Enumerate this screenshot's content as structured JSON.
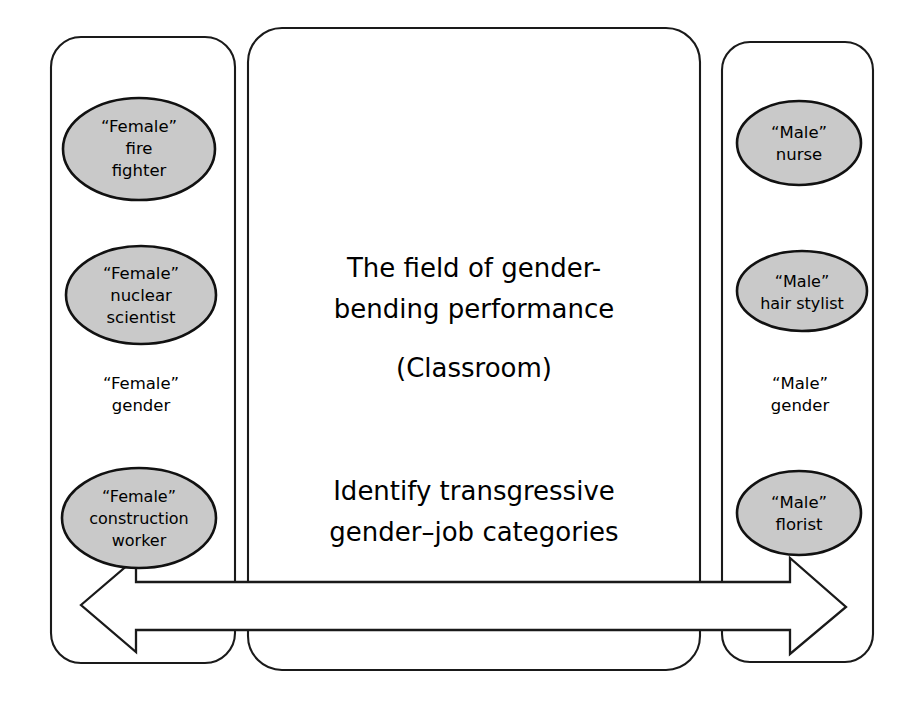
{
  "diagram": {
    "background_color": "#ffffff",
    "line_color": "#1a1a1a",
    "node_fill_color": "#c9c9c9",
    "text_color": "#000000"
  },
  "left_panel": {
    "name": "Female gender panel",
    "axis_label": {
      "line1": "“Female”",
      "line2": "gender"
    },
    "nodes": [
      {
        "id": "female-fire-fighter",
        "lines": [
          "“Female”",
          "fire",
          "fighter"
        ]
      },
      {
        "id": "female-nuclear-scientist",
        "lines": [
          "“Female”",
          "nuclear",
          "scientist"
        ]
      },
      {
        "id": "female-construction-worker",
        "lines": [
          "“Female”",
          "construction",
          "worker"
        ]
      }
    ]
  },
  "center_panel": {
    "name": "Classroom panel",
    "heading_lines": [
      "The field of gender-",
      "bending performance"
    ],
    "subtitle": "(Classroom)",
    "task_lines": [
      "Identify transgressive",
      "gender–job categories"
    ]
  },
  "right_panel": {
    "name": "Male gender panel",
    "axis_label": {
      "line1": "“Male”",
      "line2": "gender"
    },
    "nodes": [
      {
        "id": "male-nurse",
        "lines": [
          "“Male”",
          "nurse"
        ]
      },
      {
        "id": "male-hair-stylist",
        "lines": [
          "“Male”",
          "hair stylist"
        ]
      },
      {
        "id": "male-florist",
        "lines": [
          "“Male”",
          "florist"
        ]
      }
    ]
  },
  "arrow": {
    "name": "gender-continuum-double-arrow",
    "direction": "double",
    "left_end": "Female gender",
    "right_end": "Male gender"
  }
}
